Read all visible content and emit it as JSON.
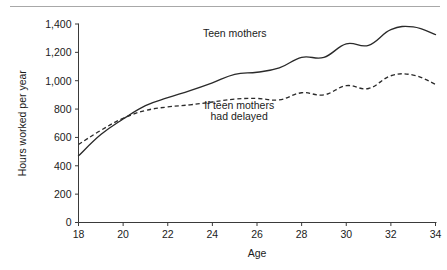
{
  "figure": {
    "has_top_rule": true,
    "background": "#ffffff",
    "ink_color": "#2a2a2a"
  },
  "chart_data": {
    "type": "line",
    "title": "",
    "subtitle": "",
    "xlabel": "Age",
    "ylabel": "Hours worked per year",
    "xlim": [
      18,
      34
    ],
    "ylim": [
      0,
      1400
    ],
    "xticks": [
      18,
      20,
      22,
      24,
      26,
      28,
      30,
      32,
      34
    ],
    "xticklabels": [
      "18",
      "20",
      "22",
      "24",
      "26",
      "28",
      "30",
      "32",
      "34"
    ],
    "yticks": [
      0,
      200,
      400,
      600,
      800,
      1000,
      1200,
      1400
    ],
    "yticklabels": [
      "0",
      "200",
      "400",
      "600",
      "800",
      "1,000",
      "1,200",
      "1,400"
    ],
    "grid": false,
    "legend_position": "inline-annotations",
    "x": [
      18,
      19,
      20,
      21,
      22,
      23,
      24,
      25,
      26,
      27,
      28,
      29,
      30,
      31,
      32,
      33,
      34
    ],
    "series": [
      {
        "name": "Teen mothers",
        "style": "solid",
        "color": "#2a2a2a",
        "label_text": "Teen mothers",
        "values": [
          470,
          620,
          730,
          825,
          880,
          930,
          985,
          1045,
          1060,
          1090,
          1165,
          1165,
          1260,
          1250,
          1360,
          1380,
          1325
        ]
      },
      {
        "name": "If teen mothers had delayed",
        "style": "dashed",
        "color": "#2a2a2a",
        "label_text": "If teen mothers\nhad delayed",
        "label_line1": "If teen mothers",
        "label_line2": "had delayed",
        "values": [
          550,
          650,
          735,
          790,
          815,
          830,
          850,
          870,
          875,
          865,
          915,
          900,
          965,
          945,
          1035,
          1040,
          975
        ]
      }
    ],
    "annotations": [
      {
        "text": "Teen mothers",
        "x": 25.0,
        "y": 1310
      },
      {
        "text": "If teen mothers",
        "x": 25.2,
        "y": 800
      },
      {
        "text": "had delayed",
        "x": 25.2,
        "y": 720
      }
    ]
  }
}
